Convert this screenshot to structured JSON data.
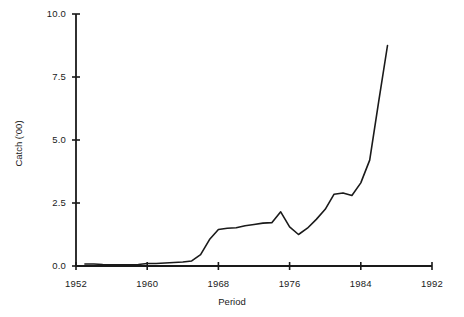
{
  "chart_data": {
    "type": "line",
    "title": "",
    "xlabel": "Period",
    "ylabel": "Catch ('00)",
    "xlim": [
      1952,
      1992
    ],
    "ylim": [
      0.0,
      10.0
    ],
    "grid": false,
    "legend": "none",
    "xticks": [
      "1952",
      "1960",
      "1968",
      "1976",
      "1984",
      "1992"
    ],
    "xtick_values": [
      1952,
      1960,
      1968,
      1976,
      1984,
      1992
    ],
    "yticks": [
      "0.0",
      "2.5",
      "5.0",
      "7.5",
      "10.0"
    ],
    "ytick_values": [
      0.0,
      2.5,
      5.0,
      7.5,
      10.0
    ],
    "line_color": "#1a1a1a",
    "line_width": 1.6,
    "series": [
      {
        "name": "Catch",
        "x": [
          1953,
          1954,
          1955,
          1956,
          1957,
          1958,
          1959,
          1960,
          1961,
          1962,
          1963,
          1964,
          1965,
          1966,
          1967,
          1968,
          1969,
          1970,
          1971,
          1972,
          1973,
          1974,
          1975,
          1976,
          1977,
          1978,
          1979,
          1980,
          1981,
          1982,
          1983,
          1984,
          1985,
          1986,
          1987
        ],
        "y": [
          0.08,
          0.08,
          0.06,
          0.05,
          0.05,
          0.05,
          0.06,
          0.1,
          0.1,
          0.12,
          0.14,
          0.16,
          0.2,
          0.45,
          1.05,
          1.45,
          1.5,
          1.52,
          1.6,
          1.65,
          1.7,
          1.72,
          2.15,
          1.55,
          1.25,
          1.5,
          1.85,
          2.25,
          2.85,
          2.9,
          2.8,
          3.3,
          4.2,
          6.5,
          8.75
        ]
      }
    ]
  }
}
